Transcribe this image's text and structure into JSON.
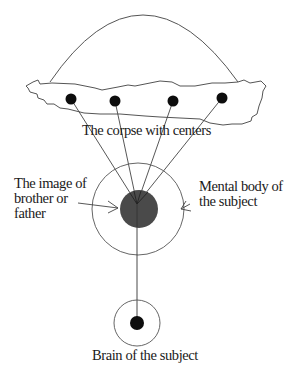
{
  "diagram": {
    "labels": {
      "corpse": "The corpse with centers",
      "image": "The image of\nbrother or\nfather",
      "mental_body": "Mental body of\nthe subject",
      "brain": "Brain of the subject"
    },
    "elements": [
      {
        "id": "arc",
        "kind": "arc",
        "desc": "Arc above the corpse"
      },
      {
        "id": "corpse",
        "kind": "irregular-shape",
        "desc": "The corpse outline"
      },
      {
        "id": "centers",
        "kind": "dots",
        "count": 4
      },
      {
        "id": "mental-body",
        "kind": "circle",
        "desc": "Mental body of the subject"
      },
      {
        "id": "image",
        "kind": "filled-circle",
        "desc": "The image of brother or father"
      },
      {
        "id": "brain",
        "kind": "circle-with-dot",
        "desc": "Brain of the subject"
      }
    ],
    "colors": {
      "line": "#444444",
      "dot": "#0d0d0d",
      "image_fill": "#4a4a4a",
      "background": "#ffffff"
    }
  }
}
